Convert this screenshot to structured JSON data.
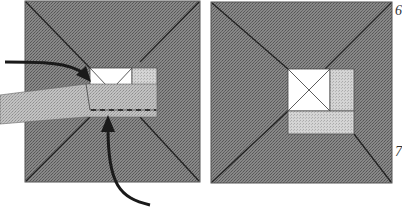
{
  "figure": {
    "type": "technical-illustration",
    "colors": {
      "background": "#ffffff",
      "panel_fill": "#7a7a7a",
      "panel_border": "#444444",
      "window_fill": "#ffffff",
      "light_fill": "#c8c8c8",
      "strip_fill": "#a8a8a8",
      "line": "#1a1a1a",
      "arrow": "#1a1a1a"
    },
    "panels": [
      {
        "name": "left-panel",
        "elements": [
          "outer-square",
          "diagonals",
          "window",
          "light-square",
          "strip",
          "dashed-line",
          "arrow-left",
          "arrow-bottom"
        ]
      },
      {
        "name": "right-panel",
        "elements": [
          "outer-square",
          "diagonals",
          "window-with-x",
          "light-right",
          "light-bottom"
        ]
      }
    ],
    "labels": {
      "top_right": "6",
      "bottom_right": "7"
    }
  }
}
